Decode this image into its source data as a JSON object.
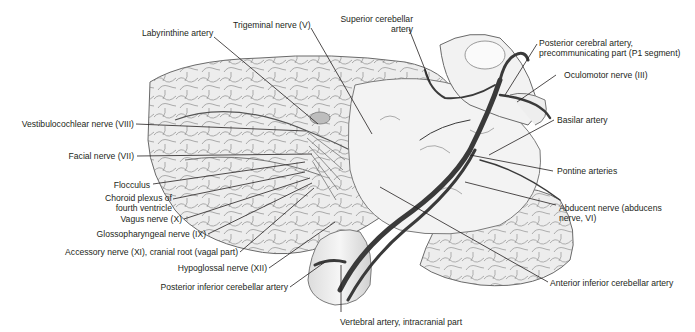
{
  "figure": {
    "colors": {
      "background": "#ffffff",
      "label_text": "#231f20",
      "leader_line": "#231f20",
      "artery": "#3a3a3a",
      "tissue": "#ececec"
    }
  },
  "labels": {
    "labyrinthine_artery": "Labyrinthine artery",
    "trigeminal_nerve": "Trigeminal nerve (V)",
    "superior_cerebellar_artery_1": "Superior cerebellar",
    "superior_cerebellar_artery_2": "artery",
    "posterior_cerebral_artery_1": "Posterior cerebral artery,",
    "posterior_cerebral_artery_2": "precommunicating part (P1 segment)",
    "oculomotor_nerve": "Oculomotor nerve (III)",
    "basilar_artery": "Basilar artery",
    "pontine_arteries": "Pontine arteries",
    "abducent_nerve_1": "Abducent nerve (abducens",
    "abducent_nerve_2": "nerve, VI)",
    "anterior_inferior_cerebellar_artery": "Anterior inferior cerebellar artery",
    "vertebral_artery": "Vertebral artery, intracranial part",
    "vestibulocochlear_nerve": "Vestibulocochlear nerve (VIII)",
    "facial_nerve": "Facial nerve (VII)",
    "flocculus": "Flocculus",
    "choroid_plexus_1": "Choroid plexus of",
    "choroid_plexus_2": "fourth ventricle",
    "vagus_nerve": "Vagus nerve (X)",
    "glossopharyngeal_nerve": "Glossopharyngeal nerve (IX)",
    "accessory_nerve": "Accessory nerve (XI), cranial root (vagal part)",
    "hypoglossal_nerve": "Hypoglossal nerve (XII)",
    "posterior_inferior_cerebellar_artery": "Posterior inferior cerebellar artery"
  }
}
